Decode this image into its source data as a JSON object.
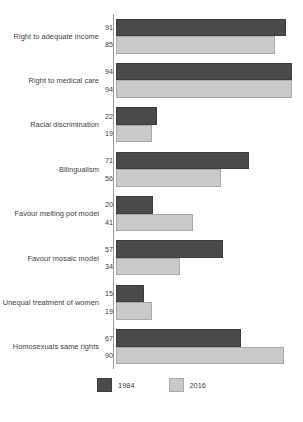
{
  "chart_data": {
    "type": "bar",
    "orientation": "horizontal",
    "title": "",
    "xlabel": "",
    "ylabel": "",
    "xlim": [
      0,
      100
    ],
    "grid": false,
    "legend_position": "bottom",
    "categories": [
      "Right to adequate income",
      "Right to medical care",
      "Racial discrimination",
      "Bilingualism",
      "Favour melting pot model",
      "Favour mosaic model",
      "Unequal treatment of women",
      "Homosexuals same rights"
    ],
    "series": [
      {
        "name": "1984",
        "color": "#4a4a4a",
        "values": [
          91,
          94,
          22,
          71,
          20,
          57,
          15,
          67
        ]
      },
      {
        "name": "2016",
        "color": "#c9c9c9",
        "values": [
          85,
          94,
          19,
          56,
          41,
          34,
          19,
          90
        ]
      }
    ]
  },
  "legend": {
    "items": [
      {
        "label": "1984"
      },
      {
        "label": "2016"
      }
    ]
  }
}
